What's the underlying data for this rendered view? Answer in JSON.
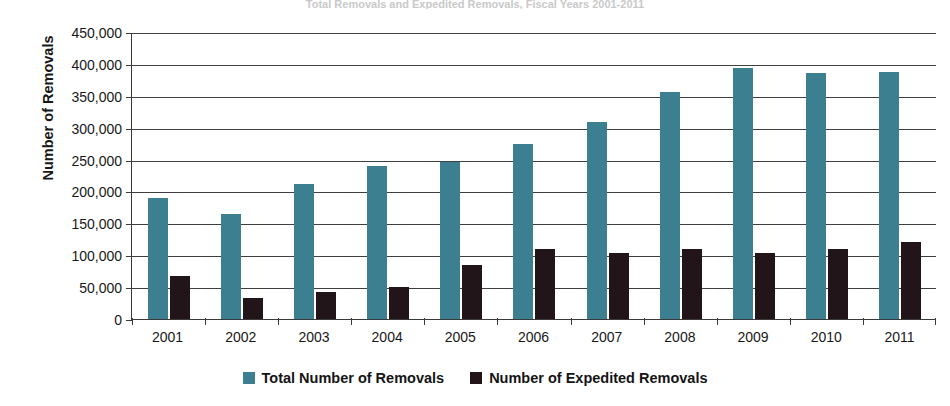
{
  "title_sliver": "Total Removals and Expedited Removals, Fiscal Years 2001-2011",
  "axes": {
    "y_title": "Number of Removals",
    "y_ticks": [
      "450,000",
      "400,000",
      "350,000",
      "300,000",
      "250,000",
      "200,000",
      "150,000",
      "100,000",
      "50,000",
      "0"
    ]
  },
  "legend": {
    "items": [
      {
        "label": "Total Number of Removals",
        "color": "#3b7f90",
        "swatch": "square-swatch"
      },
      {
        "label": "Number of Expedited Removals",
        "color": "#221519",
        "swatch": "square-swatch"
      }
    ]
  },
  "colors": {
    "total": "#3b7f90",
    "expedited": "#221519",
    "axis": "#3a3a3a",
    "grid": "#3f3f3f",
    "background": "#ffffff"
  },
  "chart_data": {
    "type": "bar",
    "title": "",
    "xlabel": "",
    "ylabel": "Number of Removals",
    "ylim": [
      0,
      450000
    ],
    "ytick_step": 50000,
    "grid": true,
    "legend_position": "bottom",
    "categories": [
      "2001",
      "2002",
      "2003",
      "2004",
      "2005",
      "2006",
      "2007",
      "2008",
      "2009",
      "2010",
      "2011"
    ],
    "series": [
      {
        "name": "Total Number of Removals",
        "color": "#3b7f90",
        "values": [
          189000,
          165000,
          211000,
          240000,
          246000,
          275000,
          309000,
          356000,
          393000,
          385000,
          387000
        ]
      },
      {
        "name": "Number of Expedited Removals",
        "color": "#221519",
        "values": [
          68000,
          33000,
          43000,
          50000,
          85000,
          110000,
          104000,
          110000,
          104000,
          110000,
          121000
        ]
      }
    ]
  }
}
